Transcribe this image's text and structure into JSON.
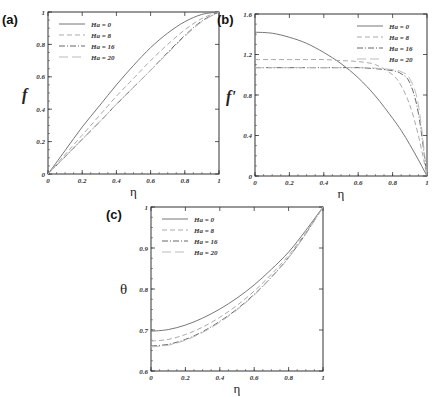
{
  "chart_data": [
    {
      "panel": "(a)",
      "type": "line",
      "xlabel": "η",
      "ylabel": "f",
      "xlim": [
        0,
        1
      ],
      "ylim": [
        0,
        1
      ],
      "xticks": [
        "0",
        "0.2",
        "0.4",
        "0.6",
        "0.8",
        "1"
      ],
      "yticks": [
        "0",
        "0.2",
        "0.4",
        "0.6",
        "0.8",
        "1"
      ],
      "legend_position": "upper-left",
      "x": [
        0,
        0.1,
        0.2,
        0.3,
        0.4,
        0.5,
        0.6,
        0.7,
        0.8,
        0.9,
        1.0
      ],
      "series": [
        {
          "name": "Ha = 0",
          "style": "solid",
          "values": [
            0,
            0.145,
            0.29,
            0.42,
            0.55,
            0.67,
            0.78,
            0.87,
            0.94,
            0.985,
            1.0
          ]
        },
        {
          "name": "Ha = 8",
          "style": "dashed",
          "values": [
            0,
            0.12,
            0.24,
            0.36,
            0.48,
            0.59,
            0.7,
            0.8,
            0.89,
            0.96,
            1.0
          ]
        },
        {
          "name": "Ha = 16",
          "style": "dashdot",
          "values": [
            0,
            0.107,
            0.214,
            0.32,
            0.43,
            0.535,
            0.64,
            0.75,
            0.855,
            0.945,
            1.0
          ]
        },
        {
          "name": "Ha = 20",
          "style": "longdash",
          "values": [
            0,
            0.107,
            0.214,
            0.32,
            0.43,
            0.535,
            0.64,
            0.745,
            0.85,
            0.94,
            1.0
          ]
        }
      ]
    },
    {
      "panel": "(b)",
      "type": "line",
      "xlabel": "η",
      "ylabel": "f'",
      "xlim": [
        0,
        1
      ],
      "ylim": [
        0,
        1.6
      ],
      "xticks": [
        "0",
        "0.2",
        "0.4",
        "0.6",
        "0.8",
        "1"
      ],
      "yticks": [
        "0",
        "0.4",
        "0.8",
        "1.2",
        "1.6"
      ],
      "legend_position": "upper-right",
      "x": [
        0,
        0.1,
        0.2,
        0.3,
        0.4,
        0.5,
        0.6,
        0.7,
        0.8,
        0.85,
        0.9,
        0.95,
        1.0
      ],
      "series": [
        {
          "name": "Ha = 0",
          "style": "solid",
          "values": [
            1.42,
            1.41,
            1.37,
            1.31,
            1.22,
            1.11,
            0.97,
            0.79,
            0.57,
            0.45,
            0.31,
            0.16,
            0
          ]
        },
        {
          "name": "Ha = 8",
          "style": "dashed",
          "values": [
            1.15,
            1.15,
            1.15,
            1.15,
            1.15,
            1.14,
            1.13,
            1.1,
            1.0,
            0.89,
            0.7,
            0.4,
            0
          ]
        },
        {
          "name": "Ha = 16",
          "style": "dashdot",
          "values": [
            1.07,
            1.07,
            1.07,
            1.07,
            1.07,
            1.07,
            1.07,
            1.06,
            1.04,
            1.01,
            0.92,
            0.62,
            0
          ]
        },
        {
          "name": "Ha = 20",
          "style": "longdash",
          "values": [
            1.07,
            1.07,
            1.07,
            1.07,
            1.07,
            1.07,
            1.07,
            1.065,
            1.05,
            1.03,
            0.96,
            0.7,
            0
          ]
        }
      ]
    },
    {
      "panel": "(c)",
      "type": "line",
      "xlabel": "η",
      "ylabel": "θ",
      "xlim": [
        0,
        1
      ],
      "ylim": [
        0.6,
        1
      ],
      "xticks": [
        "0",
        "0.2",
        "0.4",
        "0.6",
        "0.8",
        "1"
      ],
      "yticks": [
        "0.6",
        "0.7",
        "0.8",
        "0.9",
        "1"
      ],
      "legend_position": "upper-left",
      "x": [
        0,
        0.1,
        0.2,
        0.3,
        0.4,
        0.5,
        0.6,
        0.7,
        0.8,
        0.9,
        1.0
      ],
      "series": [
        {
          "name": "Ha = 0",
          "style": "solid",
          "values": [
            0.697,
            0.701,
            0.712,
            0.729,
            0.751,
            0.778,
            0.81,
            0.848,
            0.89,
            0.943,
            1.0
          ]
        },
        {
          "name": "Ha = 8",
          "style": "dashed",
          "values": [
            0.673,
            0.677,
            0.689,
            0.707,
            0.731,
            0.76,
            0.795,
            0.836,
            0.882,
            0.938,
            1.0
          ]
        },
        {
          "name": "Ha = 16",
          "style": "dashdot",
          "values": [
            0.661,
            0.665,
            0.677,
            0.696,
            0.721,
            0.751,
            0.787,
            0.829,
            0.877,
            0.935,
            1.0
          ]
        },
        {
          "name": "Ha = 20",
          "style": "longdash",
          "values": [
            0.659,
            0.663,
            0.675,
            0.694,
            0.719,
            0.749,
            0.785,
            0.828,
            0.876,
            0.934,
            1.0
          ]
        }
      ]
    }
  ],
  "layout": {
    "panels": [
      {
        "left": 48,
        "top": 12,
        "right": 219,
        "bottom": 174
      },
      {
        "left": 255,
        "top": 14,
        "right": 427,
        "bottom": 176
      },
      {
        "left": 151,
        "top": 207,
        "right": 323,
        "bottom": 371
      }
    ],
    "colors": {
      "Ha = 0": "#777777",
      "Ha = 8": "#aaaaaa",
      "Ha = 16": "#666666",
      "Ha = 20": "#bbbbbb",
      "frame": "#333333"
    },
    "dash": {
      "solid": "",
      "dashed": "5,3",
      "dashdot": "6,2,1,2",
      "longdash": "9,4"
    }
  }
}
